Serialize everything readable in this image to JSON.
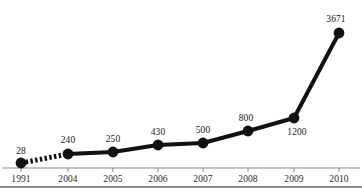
{
  "chart_data": {
    "type": "line",
    "title": "",
    "subtitle": "",
    "xlabel": "",
    "ylabel": "",
    "categories": [
      "1991",
      "2004",
      "2005",
      "2006",
      "2007",
      "2008",
      "2009",
      "2010"
    ],
    "values": [
      28,
      240,
      250,
      430,
      500,
      800,
      1200,
      3671
    ],
    "point_labels": [
      "28",
      "240",
      "250",
      "430",
      "500",
      "800",
      "1200",
      "3671"
    ],
    "label_positions": [
      "above",
      "above",
      "above",
      "above",
      "above",
      "above",
      "below-right",
      "above"
    ],
    "segment_styles": [
      "dashed",
      "solid",
      "solid",
      "solid",
      "solid",
      "solid",
      "solid"
    ],
    "ylim": [
      0,
      3671
    ],
    "grid": false,
    "legend": null,
    "series": [
      {
        "name": "",
        "values": [
          28,
          240,
          250,
          430,
          500,
          800,
          1200,
          3671
        ]
      }
    ],
    "points": [
      {
        "x": "1991",
        "y": 28,
        "label": "28",
        "px": 21,
        "py": 163,
        "label_x": 21,
        "label_y": 147
      },
      {
        "x": "2004",
        "y": 240,
        "label": "240",
        "px": 68,
        "py": 154,
        "label_x": 68,
        "label_y": 136
      },
      {
        "x": "2005",
        "y": 250,
        "label": "250",
        "px": 113,
        "py": 152,
        "label_x": 113,
        "label_y": 135
      },
      {
        "x": "2006",
        "y": 430,
        "label": "430",
        "px": 158,
        "py": 145,
        "label_x": 158,
        "label_y": 128
      },
      {
        "x": "2007",
        "y": 500,
        "label": "500",
        "px": 203,
        "py": 143,
        "label_x": 203,
        "label_y": 126
      },
      {
        "x": "2008",
        "y": 800,
        "label": "800",
        "px": 248,
        "py": 131,
        "label_x": 246,
        "label_y": 114
      },
      {
        "x": "2009",
        "y": 1200,
        "label": "1200",
        "px": 294,
        "py": 118,
        "label_x": 297,
        "label_y": 128
      },
      {
        "x": "2010",
        "y": 3671,
        "label": "3671",
        "px": 339,
        "py": 33,
        "label_x": 336,
        "label_y": 15
      }
    ],
    "axis": {
      "line_y": 168,
      "tick_labels_y": 175,
      "tick_positions": [
        21,
        68,
        113,
        158,
        203,
        248,
        294,
        339
      ],
      "bottom_rule_y": 186
    },
    "colors": {
      "line": "#111111",
      "marker": "#111111",
      "value_label": "#1a1a1a",
      "tick_label": "#2b2b2b",
      "axis": "#8c8c8c",
      "bottom_rule": "#8c8c8c",
      "background": "#ffffff"
    }
  }
}
